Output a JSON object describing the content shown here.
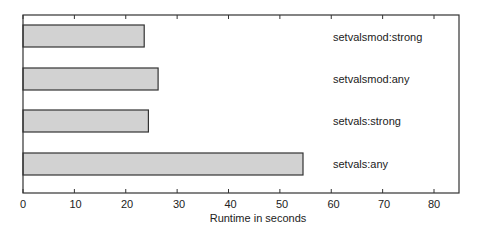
{
  "chart_data": {
    "type": "bar",
    "orientation": "horizontal",
    "title": "",
    "xlabel": "Runtime in seconds",
    "ylabel": "",
    "categories": [
      "setvalsmod:strong",
      "setvalsmod:any",
      "setvals:strong",
      "setvals:any"
    ],
    "values": [
      23.6,
      26.3,
      24.4,
      54.5
    ],
    "xlim": [
      0,
      85
    ],
    "xticks": [
      0,
      10,
      20,
      30,
      40,
      50,
      60,
      70,
      80
    ],
    "xtick_labels": [
      "0",
      "10",
      "20",
      "30",
      "40",
      "50",
      "60",
      "70",
      "80"
    ],
    "grid": false,
    "legend": "none; category labels drawn inside plot area at right",
    "bar_color": "#d2d2d2",
    "edge_color": "#333333"
  },
  "labels": {
    "xlabel": "Runtime in seconds",
    "bar0": "setvalsmod:strong",
    "bar1": "setvalsmod:any",
    "bar2": "setvals:strong",
    "bar3": "setvals:any",
    "tick0": "0",
    "tick1": "10",
    "tick2": "20",
    "tick3": "30",
    "tick4": "40",
    "tick5": "50",
    "tick6": "60",
    "tick7": "70",
    "tick8": "80"
  }
}
